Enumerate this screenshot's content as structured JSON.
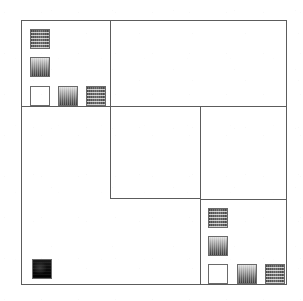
{
  "figure": {
    "background_color": "#ffffff",
    "line_color": "#5c5c5c",
    "swatch_border_color": "#6a6a6a",
    "width": 303,
    "height": 301
  },
  "frame": {
    "name": "outer-frame",
    "x": 21,
    "y": 20,
    "width": 266,
    "height": 265
  },
  "partitions": [
    {
      "name": "top-left-cell-divider-vertical",
      "type": "vline",
      "x": 110,
      "y": 20,
      "length": 86
    },
    {
      "name": "upper-band-divider-horizontal",
      "type": "hline",
      "x": 21,
      "y": 106,
      "length": 266
    },
    {
      "name": "center-cell",
      "type": "rect",
      "x": 110,
      "y": 106,
      "width": 91,
      "height": 93
    },
    {
      "name": "lower-band-divider-horizontal",
      "type": "hline",
      "x": 200,
      "y": 199,
      "length": 87
    },
    {
      "name": "bottom-right-cell-divider-vertical",
      "type": "vline",
      "x": 200,
      "y": 199,
      "length": 86
    }
  ],
  "groups": [
    {
      "name": "top-left-swatch-group",
      "cell": "top-left",
      "swatches": [
        {
          "name": "swatch-striped-1",
          "pattern": "striped",
          "x": 30,
          "y": 29,
          "size": 20
        },
        {
          "name": "swatch-gradient-1",
          "pattern": "gradient",
          "x": 30,
          "y": 57,
          "size": 20
        },
        {
          "name": "swatch-empty-1",
          "pattern": "empty",
          "x": 30,
          "y": 86,
          "size": 20
        },
        {
          "name": "swatch-gradient-2",
          "pattern": "gradient",
          "x": 58,
          "y": 86,
          "size": 20
        },
        {
          "name": "swatch-striped-2",
          "pattern": "striped",
          "x": 86,
          "y": 86,
          "size": 20
        }
      ]
    },
    {
      "name": "bottom-right-swatch-group",
      "cell": "bottom-right",
      "swatches": [
        {
          "name": "swatch-striped-3",
          "pattern": "striped",
          "x": 208,
          "y": 208,
          "size": 20
        },
        {
          "name": "swatch-gradient-3",
          "pattern": "gradient",
          "x": 208,
          "y": 236,
          "size": 20
        },
        {
          "name": "swatch-empty-2",
          "pattern": "empty",
          "x": 208,
          "y": 264,
          "size": 20
        },
        {
          "name": "swatch-gradient-4",
          "pattern": "gradient",
          "x": 237,
          "y": 264,
          "size": 20
        },
        {
          "name": "swatch-striped-4",
          "pattern": "striped",
          "x": 265,
          "y": 264,
          "size": 20
        }
      ]
    },
    {
      "name": "bottom-left-swatch-group",
      "cell": "bottom-left",
      "swatches": [
        {
          "name": "swatch-dark-1",
          "pattern": "dark",
          "x": 32,
          "y": 259,
          "size": 20
        }
      ]
    }
  ],
  "patterns": {
    "striped": {
      "label": "horizontal dither stripes",
      "fill": "#6b6b6b"
    },
    "gradient": {
      "label": "vertical gradient light-to-dark",
      "fill": "#6e6e6e"
    },
    "empty": {
      "label": "white / unfilled",
      "fill": "#ffffff"
    },
    "dark": {
      "label": "solid dark",
      "fill": "#0d0d0d"
    }
  }
}
